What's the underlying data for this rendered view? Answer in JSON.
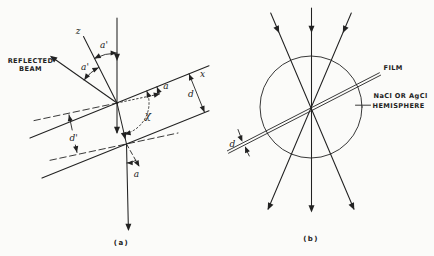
{
  "figure": {
    "background_color": "#fbfbf9",
    "ink_color": "#222222",
    "panel_a": {
      "caption": "(a)",
      "reflected_beam_label_line1": "REFLECTED",
      "reflected_beam_label_line2": "BEAM",
      "z_axis_label": "z",
      "alpha_prime_incident_label": "a'",
      "alpha_prime_reflected_label": "a'",
      "x_axis_label": "x",
      "alpha_tilt_label": "a",
      "film_thickness_label": "d",
      "chi_angle_label": "χ",
      "plane_spacing_label": "d'",
      "alpha_exit_label": "a"
    },
    "panel_b": {
      "caption": "(b)",
      "film_label": "FILM",
      "hemisphere_label_line1": "NaCl OR AgCl",
      "hemisphere_label_line2": "HEMISPHERE",
      "film_thickness_label": "d"
    }
  }
}
